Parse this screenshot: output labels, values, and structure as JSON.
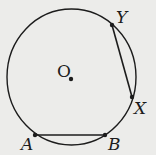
{
  "diagram": {
    "type": "circle-geometry",
    "center": {
      "label": "O"
    },
    "points": [
      {
        "label": "Y"
      },
      {
        "label": "X"
      },
      {
        "label": "A"
      },
      {
        "label": "B"
      }
    ],
    "chords": [
      "AB",
      "YX"
    ],
    "colors": {
      "stroke": "#1c1c1c",
      "background": "#ececea"
    }
  }
}
